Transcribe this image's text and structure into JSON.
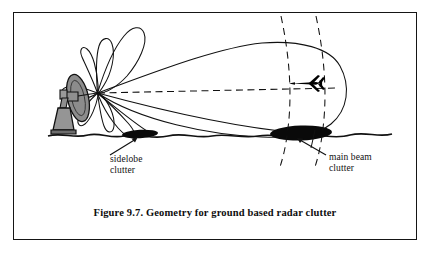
{
  "figure": {
    "caption": "Figure 9.7. Geometry for ground based radar clutter",
    "border_color": "#151515",
    "background_color": "#ffffff",
    "ink_color": "#111111"
  },
  "labels": {
    "sidelobe": {
      "line1": "sidelobe",
      "line2": "clutter"
    },
    "mainbeam": {
      "line1": "main beam",
      "line2": "clutter"
    }
  },
  "diagram": {
    "elements": [
      "radar-antenna-dish",
      "antenna-pedestal",
      "antenna-support-arm",
      "main-beam-lobe",
      "boresight-dashed-line",
      "sidelobe-petals",
      "ground-terrain-line",
      "sidelobe-clutter-patch",
      "main-beam-clutter-patch",
      "range-arc-near-dashed",
      "range-arc-far-dashed",
      "aircraft-target",
      "sidelobe-clutter-arrow",
      "main-beam-clutter-arrow"
    ],
    "dish_fill": "#8a8a8a",
    "pedestal_fill": "#8f8f8f",
    "clutter_fill": "#000000",
    "target_fill": "#000000"
  }
}
